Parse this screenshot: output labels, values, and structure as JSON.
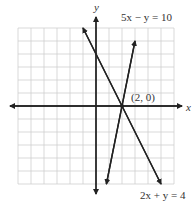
{
  "chart_data": {
    "type": "line",
    "title": "",
    "xlabel": "x",
    "ylabel": "y",
    "xlim": [
      -6,
      6
    ],
    "ylim": [
      -6,
      6
    ],
    "grid": true,
    "grid_step": 1,
    "series": [
      {
        "name": "5x − y = 10",
        "equation": "y = 5x - 10",
        "x": [
          0.8,
          3.0
        ],
        "y": [
          -6,
          5
        ]
      },
      {
        "name": "2x + y = 4",
        "equation": "y = -2x + 4",
        "x": [
          -1.0,
          5.0
        ],
        "y": [
          6,
          -6
        ]
      }
    ],
    "annotations": [
      {
        "text": "(2, 0)",
        "x": 2,
        "y": 0,
        "type": "intersection-point"
      }
    ],
    "legend": "inline labels"
  },
  "labels": {
    "x_axis": "x",
    "y_axis": "y",
    "line1": "5x − y = 10",
    "line2": "2x + y = 4",
    "point": "(2, 0)"
  },
  "colors": {
    "grid": "#cfcfcf",
    "axis": "#222222",
    "line": "#2a2a2a"
  }
}
